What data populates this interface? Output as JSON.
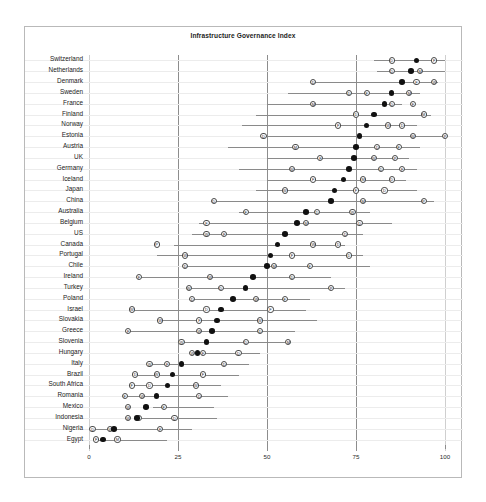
{
  "chart_data": {
    "type": "scatter",
    "title": "Infrastructure Governance Index",
    "xlabel": "",
    "ylabel": "",
    "xlim": [
      0,
      100
    ],
    "xticks": [
      0,
      25,
      50,
      75,
      100
    ],
    "xtick_labels": [
      "0",
      "25",
      "50",
      "75",
      "100"
    ],
    "gridlines": {
      "vertical": [
        0,
        25,
        50,
        75,
        100
      ],
      "horizontal_per_row": true
    },
    "legend_position": "none",
    "marker_legend": {
      "filled-dot": "composite index estimate",
      "D": "source D",
      "F": "source F",
      "M": "source M",
      "W": "source W",
      "P": "source P"
    },
    "categories": [
      "Switzerland",
      "Netherlands",
      "Denmark",
      "Sweden",
      "France",
      "Finland",
      "Norway",
      "Estonia",
      "Austria",
      "UK",
      "Germany",
      "Iceland",
      "Japan",
      "China",
      "Australia",
      "Belgium",
      "US",
      "Canada",
      "Portugal",
      "Chile",
      "Ireland",
      "Turkey",
      "Poland",
      "Israel",
      "Slovakia",
      "Greece",
      "Slovenia",
      "Hungary",
      "Italy",
      "Brazil",
      "South Africa",
      "Romania",
      "Mexico",
      "Indonesia",
      "Nigeria",
      "Egypt"
    ],
    "values": [
      92,
      90.5,
      88,
      85,
      83,
      80,
      78,
      76,
      75,
      74.5,
      73,
      71.5,
      69,
      68,
      61,
      58.5,
      55,
      53,
      51,
      50,
      46,
      44,
      40.5,
      37,
      36,
      34.5,
      33,
      30.5,
      26,
      23.5,
      22,
      19,
      16,
      13.5,
      7,
      4
    ],
    "ranges": [
      [
        80,
        100
      ],
      [
        81,
        100
      ],
      [
        63,
        98
      ],
      [
        56,
        93
      ],
      [
        50,
        88
      ],
      [
        47,
        96
      ],
      [
        43,
        92
      ],
      [
        49,
        100
      ],
      [
        39,
        93
      ],
      [
        50,
        90
      ],
      [
        42,
        92
      ],
      [
        50,
        89
      ],
      [
        47,
        92
      ],
      [
        35,
        97
      ],
      [
        42,
        79
      ],
      [
        31,
        85
      ],
      [
        29,
        77
      ],
      [
        24,
        72
      ],
      [
        19,
        77
      ],
      [
        27,
        79
      ],
      [
        14,
        68
      ],
      [
        28,
        72
      ],
      [
        28,
        62
      ],
      [
        12,
        61
      ],
      [
        20,
        64
      ],
      [
        11,
        58
      ],
      [
        26,
        55
      ],
      [
        29,
        48
      ],
      [
        17,
        45
      ],
      [
        13,
        42
      ],
      [
        12,
        37
      ],
      [
        10,
        39
      ],
      [
        18,
        35
      ],
      [
        15,
        36
      ],
      [
        1,
        29
      ],
      [
        2,
        22
      ]
    ],
    "source_markers": [
      [
        {
          "id": "D",
          "x": 85
        },
        {
          "id": "F",
          "x": 97
        }
      ],
      [
        {
          "id": "D",
          "x": 85
        },
        {
          "id": "M",
          "x": 93
        }
      ],
      [
        {
          "id": "D",
          "x": 63
        },
        {
          "id": "F",
          "x": 92
        },
        {
          "id": "W",
          "x": 97
        }
      ],
      [
        {
          "id": "D",
          "x": 73
        },
        {
          "id": "F",
          "x": 78
        },
        {
          "id": "M",
          "x": 90
        }
      ],
      [
        {
          "id": "M",
          "x": 63
        },
        {
          "id": "D",
          "x": 85
        },
        {
          "id": "F",
          "x": 91
        }
      ],
      [
        {
          "id": "D",
          "x": 75
        },
        {
          "id": "M",
          "x": 94
        }
      ],
      [
        {
          "id": "F",
          "x": 70
        },
        {
          "id": "W",
          "x": 84
        },
        {
          "id": "D",
          "x": 88
        }
      ],
      [
        {
          "id": "D",
          "x": 49
        },
        {
          "id": "W",
          "x": 91
        },
        {
          "id": "P",
          "x": 100
        }
      ],
      [
        {
          "id": "M",
          "x": 58
        },
        {
          "id": "D",
          "x": 81
        },
        {
          "id": "F",
          "x": 87
        }
      ],
      [
        {
          "id": "F",
          "x": 65
        },
        {
          "id": "W",
          "x": 80
        },
        {
          "id": "P",
          "x": 86
        }
      ],
      [
        {
          "id": "W",
          "x": 57
        },
        {
          "id": "D",
          "x": 82
        },
        {
          "id": "F",
          "x": 88
        }
      ],
      [
        {
          "id": "F",
          "x": 63
        },
        {
          "id": "M",
          "x": 77
        },
        {
          "id": "D",
          "x": 85
        }
      ],
      [
        {
          "id": "W",
          "x": 55
        },
        {
          "id": "F",
          "x": 75
        },
        {
          "id": "D",
          "x": 83
        }
      ],
      [
        {
          "id": "D",
          "x": 35
        },
        {
          "id": "M",
          "x": 77
        },
        {
          "id": "P",
          "x": 94
        }
      ],
      [
        {
          "id": "F",
          "x": 44
        },
        {
          "id": "D",
          "x": 64
        },
        {
          "id": "W",
          "x": 74
        }
      ],
      [
        {
          "id": "F",
          "x": 33
        },
        {
          "id": "M",
          "x": 61
        },
        {
          "id": "D",
          "x": 76
        }
      ],
      [
        {
          "id": "W",
          "x": 33
        },
        {
          "id": "F",
          "x": 38
        },
        {
          "id": "D",
          "x": 72
        }
      ],
      [
        {
          "id": "P",
          "x": 19
        },
        {
          "id": "W",
          "x": 63
        },
        {
          "id": "D",
          "x": 70
        }
      ],
      [
        {
          "id": "W",
          "x": 27
        },
        {
          "id": "F",
          "x": 57
        },
        {
          "id": "D",
          "x": 73
        }
      ],
      [
        {
          "id": "D",
          "x": 27
        },
        {
          "id": "M",
          "x": 52
        },
        {
          "id": "F",
          "x": 62
        }
      ],
      [
        {
          "id": "F",
          "x": 14
        },
        {
          "id": "W",
          "x": 34
        },
        {
          "id": "D",
          "x": 57
        }
      ],
      [
        {
          "id": "W",
          "x": 28
        },
        {
          "id": "D",
          "x": 37
        },
        {
          "id": "P",
          "x": 68
        }
      ],
      [
        {
          "id": "D",
          "x": 29
        },
        {
          "id": "W",
          "x": 47
        },
        {
          "id": "F",
          "x": 55
        }
      ],
      [
        {
          "id": "W",
          "x": 12
        },
        {
          "id": "D",
          "x": 33
        },
        {
          "id": "F",
          "x": 51
        }
      ],
      [
        {
          "id": "W",
          "x": 20
        },
        {
          "id": "F",
          "x": 31
        },
        {
          "id": "W",
          "x": 48
        }
      ],
      [
        {
          "id": "F",
          "x": 11
        },
        {
          "id": "W",
          "x": 31
        },
        {
          "id": "D",
          "x": 48
        }
      ],
      [
        {
          "id": "W",
          "x": 26
        },
        {
          "id": "D",
          "x": 44
        },
        {
          "id": "M",
          "x": 56
        }
      ],
      [
        {
          "id": "W",
          "x": 29
        },
        {
          "id": "F",
          "x": 32
        },
        {
          "id": "D",
          "x": 42
        }
      ],
      [
        {
          "id": "W",
          "x": 17
        },
        {
          "id": "F",
          "x": 22
        },
        {
          "id": "D",
          "x": 38
        }
      ],
      [
        {
          "id": "D",
          "x": 13
        },
        {
          "id": "W",
          "x": 19
        },
        {
          "id": "F",
          "x": 32
        }
      ],
      [
        {
          "id": "F",
          "x": 12
        },
        {
          "id": "D",
          "x": 17
        },
        {
          "id": "W",
          "x": 30
        }
      ],
      [
        {
          "id": "F",
          "x": 10
        },
        {
          "id": "W",
          "x": 15
        },
        {
          "id": "D",
          "x": 31
        }
      ],
      [
        {
          "id": "W",
          "x": 11
        },
        {
          "id": "F",
          "x": 21
        }
      ],
      [
        {
          "id": "W",
          "x": 11
        },
        {
          "id": "F",
          "x": 14
        },
        {
          "id": "D",
          "x": 24
        }
      ],
      [
        {
          "id": "D",
          "x": 1
        },
        {
          "id": "W",
          "x": 6
        },
        {
          "id": "F",
          "x": 20
        }
      ],
      [
        {
          "id": "F",
          "x": 2
        },
        {
          "id": "M",
          "x": 8
        }
      ]
    ]
  }
}
